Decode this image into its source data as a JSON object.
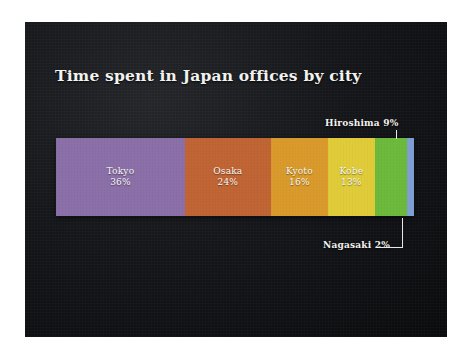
{
  "slide": {
    "background_color": "#14161a",
    "frame_color": "#ffffff"
  },
  "chart_data": {
    "type": "bar",
    "orientation": "horizontal",
    "stacked": true,
    "normalized_percent": true,
    "title": "Time spent in Japan offices by city",
    "subtitle": "",
    "xlabel": "",
    "ylabel": "",
    "xlim": [
      0,
      100
    ],
    "grid": false,
    "legend_position": "none",
    "value_unit": "%",
    "categories": [
      "Tokyo",
      "Osaka",
      "Kyoto",
      "Kobe",
      "Hiroshima",
      "Nagasaki"
    ],
    "values": [
      36,
      24,
      16,
      13,
      9,
      2
    ],
    "colors": [
      "#8a6fa8",
      "#c06434",
      "#d99a2b",
      "#e0cc38",
      "#6cb93c",
      "#7e9fd4"
    ],
    "segments": [
      {
        "name": "Tokyo",
        "value": 36,
        "value_label": "36%",
        "color": "#8a6fa8",
        "label_inside": true
      },
      {
        "name": "Osaka",
        "value": 24,
        "value_label": "24%",
        "color": "#c06434",
        "label_inside": true
      },
      {
        "name": "Kyoto",
        "value": 16,
        "value_label": "16%",
        "color": "#d99a2b",
        "label_inside": true
      },
      {
        "name": "Kobe",
        "value": 13,
        "value_label": "13%",
        "color": "#e0cc38",
        "label_inside": true
      },
      {
        "name": "Hiroshima",
        "value": 9,
        "value_label": "9%",
        "color": "#6cb93c",
        "label_inside": false
      },
      {
        "name": "Nagasaki",
        "value": 2,
        "value_label": "2%",
        "color": "#7e9fd4",
        "label_inside": false
      }
    ],
    "annotations": [
      {
        "text": "Hiroshima 9%",
        "target": "Hiroshima",
        "position": "above-right"
      },
      {
        "text": "Nagasaki 2%",
        "target": "Nagasaki",
        "position": "below-right"
      }
    ]
  }
}
